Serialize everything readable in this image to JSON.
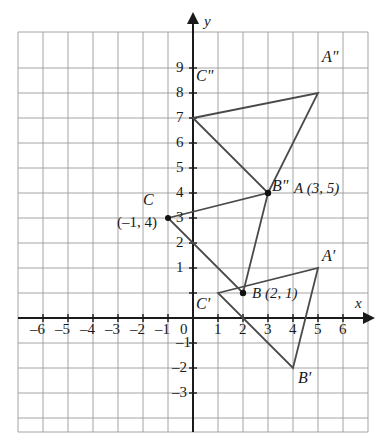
{
  "figure": {
    "kind": "coordinate-plane-triangles",
    "grid": {
      "x_min": -7,
      "x_max": 7,
      "y_min": -4,
      "y_max": 10,
      "cell_px": 25,
      "origin_px": [
        193,
        318
      ],
      "grid_color": "#9a9a9a",
      "axis_color": "#1a1a1a",
      "shape_color": "#4a4a4a",
      "show_grid": true
    },
    "axes": {
      "x_label": "x",
      "y_label": "y",
      "x_ticks": [
        -6,
        -5,
        -4,
        -3,
        -2,
        -1,
        0,
        1,
        2,
        3,
        4,
        5,
        6
      ],
      "y_ticks": [
        -3,
        -2,
        -1,
        1,
        2,
        3,
        4,
        5,
        6,
        7,
        8,
        9
      ],
      "origin_tick": "0"
    },
    "tick_text": {
      "xm6": "–6",
      "xm5": "–5",
      "xm4": "–4",
      "xm3": "–3",
      "xm2": "–2",
      "xm1": "–1",
      "zero": "0",
      "x1": "1",
      "x2": "2",
      "x3": "3",
      "x4": "4",
      "x5": "5",
      "x6": "6",
      "ym1": "–1",
      "ym2": "–2",
      "ym3": "–3",
      "y1": "1",
      "y2": "2",
      "y3": "3",
      "y4": "4",
      "y5": "5",
      "y6": "6",
      "y7": "7",
      "y8": "8",
      "y9": "9"
    },
    "triangles": [
      {
        "name": "triangle-original",
        "vertices": [
          {
            "id": "A",
            "x": 3,
            "y": 5
          },
          {
            "id": "B",
            "x": 2,
            "y": 1
          },
          {
            "id": "C",
            "x": -1,
            "y": 4
          }
        ]
      },
      {
        "name": "triangle-image-prime",
        "vertices": [
          {
            "id": "A'",
            "x": 5,
            "y": 2
          },
          {
            "id": "B'",
            "x": 4,
            "y": -2
          },
          {
            "id": "C'",
            "x": 1,
            "y": 1
          }
        ]
      },
      {
        "name": "triangle-image-double-prime",
        "vertices": [
          {
            "id": "A\"",
            "x": 5,
            "y": 9
          },
          {
            "id": "B\"",
            "x": 3,
            "y": 5
          },
          {
            "id": "C\"",
            "x": 0,
            "y": 8
          }
        ]
      }
    ],
    "point_markers": [
      {
        "name": "marker-C",
        "x": -1,
        "y": 4
      },
      {
        "name": "marker-A-Bdoubleprime",
        "x": 3,
        "y": 5
      },
      {
        "name": "marker-B",
        "x": 2,
        "y": 1
      }
    ],
    "labels": {
      "A_double_prime": "A\"",
      "C_double_prime": "C\"",
      "B_double_prime": "B\"",
      "A_with_coords": "A (3, 5)",
      "C": "C",
      "C_coords": "(–1, 4)",
      "C_prime": "C′",
      "B_with_coords": "B (2, 1)",
      "A_prime": "A′",
      "B_prime": "B′"
    }
  }
}
